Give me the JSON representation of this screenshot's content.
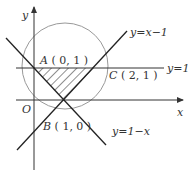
{
  "diagram": {
    "axes": {
      "x_label": "x",
      "y_label": "y",
      "origin_label": "O"
    },
    "points": [
      {
        "name": "A",
        "coords": "( 0, 1 )"
      },
      {
        "name": "B",
        "coords": "( 1, 0 )"
      },
      {
        "name": "C",
        "coords": "( 2, 1 )"
      }
    ],
    "lines": [
      {
        "label": "y=x−1"
      },
      {
        "label": "y=1"
      },
      {
        "label": "y=1−x"
      }
    ],
    "shaded_region": "triangle ABC (hatched)",
    "circle": "circle through A, B, C",
    "colors": {
      "line": "#333333",
      "circle": "#999999",
      "hatch": "#444444"
    }
  }
}
